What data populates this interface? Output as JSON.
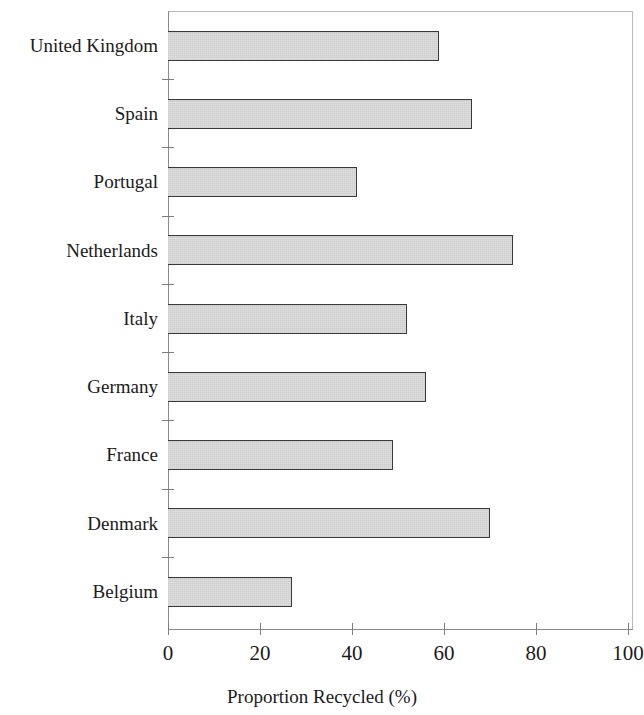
{
  "chart_data": {
    "type": "bar",
    "orientation": "horizontal",
    "title": "",
    "subtitle": "",
    "xlabel": "Proportion Recycled (%)",
    "ylabel": "",
    "categories": [
      "Belgium",
      "Denmark",
      "France",
      "Germany",
      "Italy",
      "Netherlands",
      "Portugal",
      "Spain",
      "United Kingdom"
    ],
    "values": [
      27,
      70,
      49,
      56,
      52,
      75,
      41,
      66,
      59
    ],
    "series": [
      {
        "name": "Proportion Recycled (%)",
        "values": [
          27,
          70,
          49,
          56,
          52,
          75,
          41,
          66,
          59
        ]
      }
    ],
    "display_order_top_to_bottom": [
      {
        "category": "United Kingdom",
        "value": 59
      },
      {
        "category": "Spain",
        "value": 66
      },
      {
        "category": "Portugal",
        "value": 41
      },
      {
        "category": "Netherlands",
        "value": 75
      },
      {
        "category": "Italy",
        "value": 52
      },
      {
        "category": "Germany",
        "value": 56
      },
      {
        "category": "France",
        "value": 49
      },
      {
        "category": "Denmark",
        "value": 70
      },
      {
        "category": "Belgium",
        "value": 27
      }
    ],
    "xlim": [
      0,
      100
    ],
    "xticks": [
      0,
      20,
      40,
      60,
      80,
      100
    ],
    "xticklabels": [
      "0",
      "20",
      "40",
      "60",
      "80",
      "100"
    ],
    "grid": false,
    "legend": null,
    "bar_fill_color": "#dedede",
    "bar_edge_color": "#3a3a3a",
    "axis_color": "#8a8a8a",
    "frame_color": "#b9b9b9",
    "background_color": "#ffffff",
    "text_color": "#1b1b1b"
  },
  "axis": {
    "x_title": "Proportion Recycled (%)",
    "tick_labels": [
      "0",
      "20",
      "40",
      "60",
      "80",
      "100"
    ]
  },
  "labels": {
    "united_kingdom": "United Kingdom",
    "spain": "Spain",
    "portugal": "Portugal",
    "netherlands": "Netherlands",
    "italy": "Italy",
    "germany": "Germany",
    "france": "France",
    "denmark": "Denmark",
    "belgium": "Belgium"
  }
}
